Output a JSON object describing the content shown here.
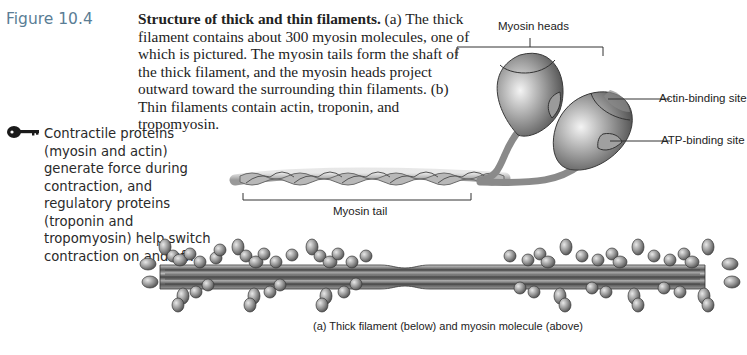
{
  "figure": {
    "number_label": "Figure 10.4",
    "title": "Structure of thick and thin filaments.",
    "caption_body": " (a) The thick filament contains about 300 myosin molecules, one of which is pictured. The myosin tails form the shaft of the thick filament, and the myosin heads project outward toward the surrounding thin filaments. (b) Thin filaments contain actin, troponin, and tropomyosin.",
    "label_color": "#5a7d95"
  },
  "key_note": {
    "icon": "key-icon",
    "text": "Contractile proteins (myosin and actin) generate force during contraction, and regulatory proteins (troponin and tropomyosin) help switch contraction on and off."
  },
  "diagram": {
    "labels": {
      "myosin_heads": "Myosin heads",
      "actin_binding_site": "Actin-binding site",
      "atp_binding_site": "ATP-binding site",
      "myosin_tail": "Myosin tail"
    },
    "subcaption": "(a) Thick filament (below) and myosin molecule (above)"
  }
}
